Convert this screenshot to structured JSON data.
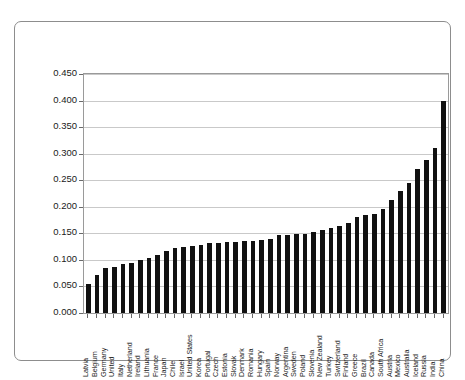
{
  "figure": {
    "cropped_caption_sliver": "",
    "frame_style": "rounded-rectangle-border"
  },
  "chart_data": {
    "type": "bar",
    "title": "",
    "subtitle": "",
    "xlabel": "",
    "ylabel": "",
    "ylim": [
      0.0,
      0.45
    ],
    "ytick_labels": [
      "0.000",
      "0.050",
      "0.100",
      "0.150",
      "0.200",
      "0.250",
      "0.300",
      "0.350",
      "0.400",
      "0.450"
    ],
    "ytick_values": [
      0.0,
      0.05,
      0.1,
      0.15,
      0.2,
      0.25,
      0.3,
      0.35,
      0.4,
      0.45
    ],
    "grid": true,
    "grid_axis": "y",
    "legend": false,
    "legend_position": "none",
    "bar_color": "#111111",
    "categories": [
      "Latvia",
      "Belgium",
      "Germany",
      "United",
      "Italy",
      "Netherland",
      "Ireland",
      "Lithuania",
      "France",
      "Japan",
      "Chile",
      "Israel",
      "United States",
      "Korea",
      "Portugal",
      "Czech",
      "Estonia",
      "Slovak",
      "Denmark",
      "Romania",
      "Hungary",
      "Spain",
      "Norway",
      "Argentina",
      "Sweden",
      "Poland",
      "Slovenia",
      "New Zealand",
      "Turkey",
      "Switzerland",
      "Finland",
      "Greece",
      "Brazil",
      "Canada",
      "South Africa",
      "Austria",
      "Mexico",
      "Australia",
      "Iceland",
      "Russia",
      "India",
      "China"
    ],
    "values": [
      0.055,
      0.072,
      0.085,
      0.087,
      0.092,
      0.095,
      0.1,
      0.103,
      0.11,
      0.117,
      0.122,
      0.125,
      0.127,
      0.129,
      0.131,
      0.132,
      0.133,
      0.134,
      0.135,
      0.136,
      0.137,
      0.14,
      0.146,
      0.147,
      0.148,
      0.149,
      0.152,
      0.156,
      0.16,
      0.163,
      0.17,
      0.18,
      0.184,
      0.186,
      0.196,
      0.212,
      0.23,
      0.244,
      0.272,
      0.288,
      0.31,
      0.4
    ]
  }
}
